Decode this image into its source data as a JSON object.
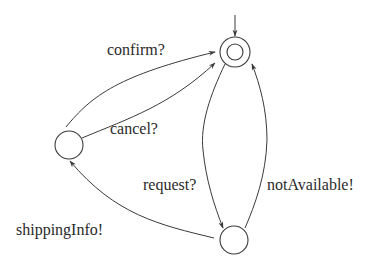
{
  "diagram": {
    "type": "state-machine",
    "states": [
      {
        "id": "s0",
        "name": "initial-state",
        "initial": true,
        "double_circle": true
      },
      {
        "id": "s1",
        "name": "left-state",
        "initial": false,
        "double_circle": false
      },
      {
        "id": "s2",
        "name": "bottom-state",
        "initial": false,
        "double_circle": false
      }
    ],
    "transitions": [
      {
        "from": "s1",
        "to": "s0",
        "label": "confirm?"
      },
      {
        "from": "s1",
        "to": "s0",
        "label": "cancel?"
      },
      {
        "from": "s0",
        "to": "s2",
        "label": "request?"
      },
      {
        "from": "s2",
        "to": "s0",
        "label": "notAvailable!"
      },
      {
        "from": "s2",
        "to": "s1",
        "label": "shippingInfo!"
      }
    ],
    "labels": {
      "confirm": "confirm?",
      "cancel": "cancel?",
      "request": "request?",
      "not_available": "notAvailable!",
      "shipping_info": "shippingInfo!"
    },
    "colors": {
      "stroke": "#3a3a3a",
      "text": "#2a2a2a",
      "background": "#ffffff"
    }
  }
}
